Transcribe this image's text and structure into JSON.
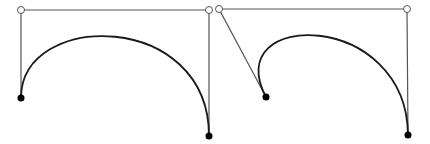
{
  "diagram": {
    "type": "cubic-bezier-comparison",
    "colors": {
      "background": "#ffffff",
      "curve": "#1a1a1a",
      "handle": "#555555",
      "anchor": "#000000",
      "control_fill": "#ffffff"
    },
    "panels": [
      {
        "name": "bezier-left",
        "start": [
          21,
          98
        ],
        "control1": [
          21,
          10
        ],
        "control2": [
          209,
          10
        ],
        "end": [
          209,
          136
        ]
      },
      {
        "name": "bezier-right",
        "start": [
          266,
          97
        ],
        "control1": [
          219,
          9
        ],
        "control2": [
          407,
          9
        ],
        "end": [
          408,
          135
        ]
      }
    ]
  }
}
